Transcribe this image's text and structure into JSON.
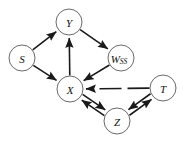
{
  "diagram": {
    "type": "directed-graph",
    "width": 189,
    "height": 146,
    "background_color": "#ffffff",
    "node_fill_color": "#ffffff",
    "node_stroke_color": "#6b6b6b",
    "edge_color": "#1a1a1a",
    "node_radius": 13,
    "nodes": [
      {
        "id": "Y",
        "label": "Y",
        "sublabel": "",
        "cx": 69,
        "cy": 22
      },
      {
        "id": "S",
        "label": "S",
        "sublabel": "",
        "cx": 22,
        "cy": 58
      },
      {
        "id": "WSS",
        "label": "W",
        "sublabel": "SS",
        "cx": 121,
        "cy": 58
      },
      {
        "id": "X",
        "label": "X",
        "sublabel": "",
        "cx": 70,
        "cy": 89
      },
      {
        "id": "Z",
        "label": "Z",
        "sublabel": "",
        "cx": 117,
        "cy": 121
      },
      {
        "id": "T",
        "label": "T",
        "sublabel": "",
        "cx": 163,
        "cy": 88
      }
    ],
    "edges": [
      {
        "from": "S",
        "to": "Y",
        "style": "solid",
        "arrow": "single"
      },
      {
        "from": "S",
        "to": "X",
        "style": "solid",
        "arrow": "single"
      },
      {
        "from": "X",
        "to": "Y",
        "style": "solid",
        "arrow": "single"
      },
      {
        "from": "Y",
        "to": "WSS",
        "style": "solid",
        "arrow": "single"
      },
      {
        "from": "WSS",
        "to": "X",
        "style": "solid",
        "arrow": "single"
      },
      {
        "from": "T",
        "to": "X",
        "style": "dashed",
        "arrow": "single"
      },
      {
        "from": "X",
        "to": "Z",
        "style": "solid",
        "arrow": "single"
      },
      {
        "from": "Z",
        "to": "X",
        "style": "solid",
        "arrow": "single"
      },
      {
        "from": "Z",
        "to": "T",
        "style": "solid",
        "arrow": "single"
      },
      {
        "from": "T",
        "to": "Z",
        "style": "solid",
        "arrow": "single"
      }
    ]
  }
}
